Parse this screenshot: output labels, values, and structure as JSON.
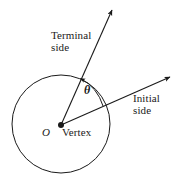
{
  "figure": {
    "background_color": "#ffffff",
    "stroke_color": "#1a1a1a",
    "labels": {
      "terminal_side_line1": "Terminal",
      "terminal_side_line2": "side",
      "initial_side_line1": "Initial",
      "initial_side_line2": "side",
      "vertex": "Vertex",
      "origin": "O",
      "angle_symbol": "θ"
    },
    "geometry": {
      "circle": {
        "cx": 61,
        "cy": 124,
        "r": 49
      },
      "vertex_point": {
        "x": 61,
        "y": 125,
        "radius": 3
      },
      "terminal_ray": {
        "x1": 61,
        "y1": 125,
        "x2": 113,
        "y2": 8
      },
      "initial_ray": {
        "x1": 61,
        "y1": 125,
        "x2": 172,
        "y2": 76
      },
      "angle_arc": {
        "cx": 61,
        "cy": 125,
        "r": 46,
        "start_deg": 24,
        "end_deg": 66
      }
    }
  }
}
